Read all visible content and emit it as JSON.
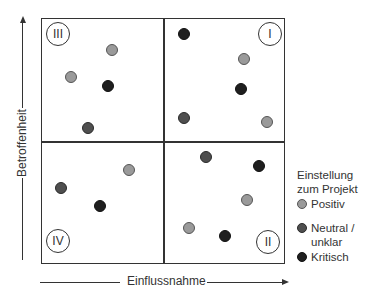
{
  "diagram": {
    "type": "stakeholder-portfolio-matrix",
    "y_axis_label": "Betroffenheit",
    "x_axis_label": "Einflussnahme",
    "quadrants": [
      {
        "id": "III",
        "label": "III",
        "position": "top-left",
        "label_x": 58,
        "label_y": 34
      },
      {
        "id": "I",
        "label": "I",
        "position": "top-right",
        "label_x": 270,
        "label_y": 34
      },
      {
        "id": "IV",
        "label": "IV",
        "position": "bottom-left",
        "label_x": 58,
        "label_y": 241
      },
      {
        "id": "II",
        "label": "II",
        "position": "bottom-right",
        "label_x": 268,
        "label_y": 242
      }
    ],
    "legend": {
      "title_line1": "Einstellung",
      "title_line2": "zum Projekt",
      "items": [
        {
          "key": "positiv",
          "label": "Positiv",
          "color": "#9a9a9a"
        },
        {
          "key": "neutral",
          "label_line1": "Neutral /",
          "label_line2": "unklar",
          "color": "#4f4f4f"
        },
        {
          "key": "kritisch",
          "label": "Kritisch",
          "color": "#1f1f1f"
        }
      ]
    },
    "points": [
      {
        "quadrant": "III",
        "x": 112,
        "y": 50,
        "category": "positiv"
      },
      {
        "quadrant": "III",
        "x": 71,
        "y": 77,
        "category": "positiv"
      },
      {
        "quadrant": "III",
        "x": 108,
        "y": 86,
        "category": "kritisch"
      },
      {
        "quadrant": "III",
        "x": 88,
        "y": 128,
        "category": "neutral"
      },
      {
        "quadrant": "I",
        "x": 184,
        "y": 34,
        "category": "kritisch"
      },
      {
        "quadrant": "I",
        "x": 244,
        "y": 59,
        "category": "positiv"
      },
      {
        "quadrant": "I",
        "x": 241,
        "y": 89,
        "category": "kritisch"
      },
      {
        "quadrant": "I",
        "x": 184,
        "y": 118,
        "category": "neutral"
      },
      {
        "quadrant": "I",
        "x": 267,
        "y": 122,
        "category": "positiv"
      },
      {
        "quadrant": "IV",
        "x": 129,
        "y": 170,
        "category": "positiv"
      },
      {
        "quadrant": "IV",
        "x": 61,
        "y": 188,
        "category": "neutral"
      },
      {
        "quadrant": "IV",
        "x": 100,
        "y": 206,
        "category": "kritisch"
      },
      {
        "quadrant": "II",
        "x": 206,
        "y": 157,
        "category": "neutral"
      },
      {
        "quadrant": "II",
        "x": 259,
        "y": 166,
        "category": "kritisch"
      },
      {
        "quadrant": "II",
        "x": 247,
        "y": 200,
        "category": "positiv"
      },
      {
        "quadrant": "II",
        "x": 189,
        "y": 228,
        "category": "positiv"
      },
      {
        "quadrant": "II",
        "x": 225,
        "y": 236,
        "category": "kritisch"
      }
    ]
  }
}
